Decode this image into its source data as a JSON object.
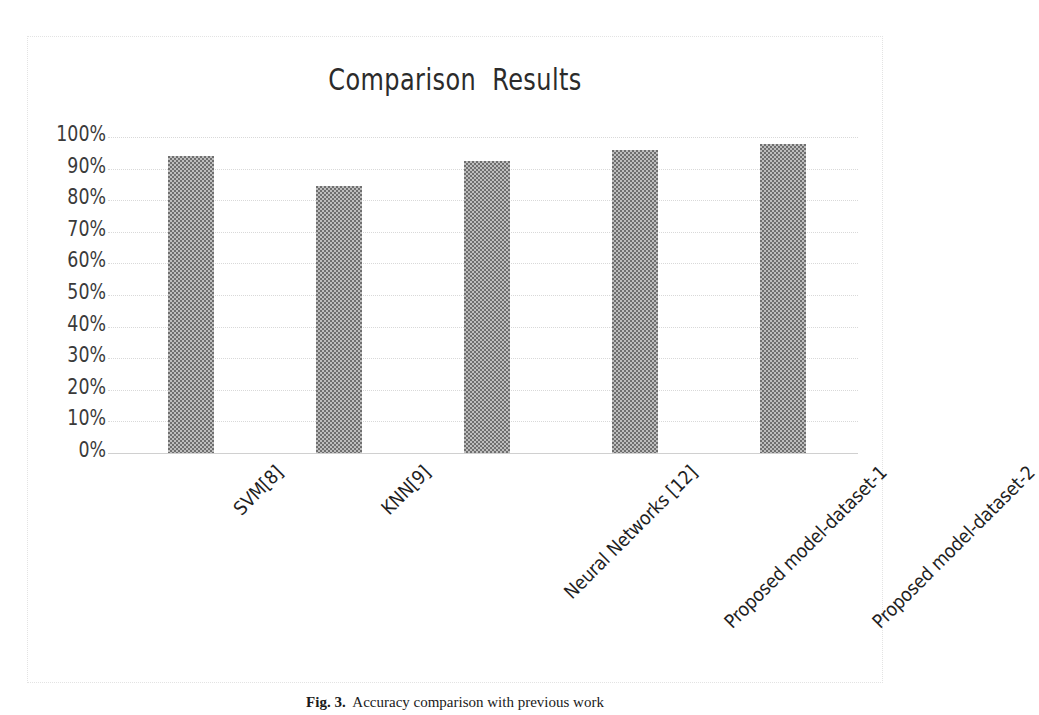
{
  "chart_data": {
    "type": "bar",
    "title": "Comparison  Results",
    "xlabel": "",
    "ylabel": "",
    "ylim": [
      0,
      100
    ],
    "grid": true,
    "legend": "none",
    "categories": [
      "SVM[8]",
      "KNN[9]",
      "Neural Networks [12]",
      "Proposed model-dataset-1",
      "Proposed model-dataset-2"
    ],
    "values": [
      94,
      84.5,
      92.4,
      95.9,
      97.8
    ],
    "value_labels": [
      "94%",
      "84.5%",
      "92.4%",
      "95.9%",
      "97.8%"
    ],
    "ytick_labels": [
      "100%",
      "90%",
      "80%",
      "70%",
      "60%",
      "50%",
      "40%",
      "30%",
      "20%",
      "10%",
      "0%"
    ],
    "ytick_values": [
      100,
      90,
      80,
      70,
      60,
      50,
      40,
      30,
      20,
      10,
      0
    ],
    "series": [
      {
        "name": "Accuracy",
        "values": [
          94,
          84.5,
          92.4,
          95.9,
          97.8
        ]
      }
    ],
    "bar_color": "#6f6f6f",
    "bar_pattern": "checkered-gray"
  },
  "caption": {
    "label": "Fig. 3.",
    "text": "  Accuracy comparison with previous work"
  }
}
